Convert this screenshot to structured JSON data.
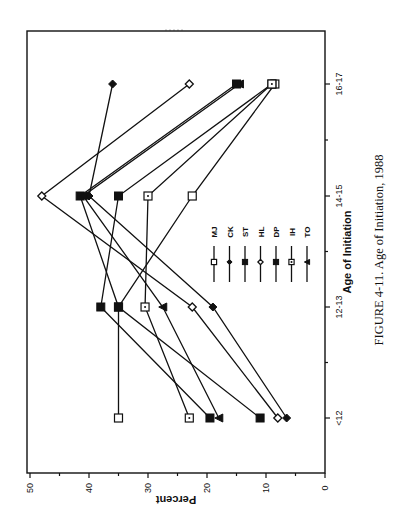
{
  "chart_data": {
    "type": "line",
    "orientation": "rotated-90-clockwise",
    "title": "",
    "caption": "FIGURE 4-11. Age of Initiation, 1988",
    "xlabel": "Age of Initiation",
    "ylabel": "Percent",
    "categories": [
      "<12",
      "12-13",
      "14-15",
      "16-17"
    ],
    "ylim": [
      0,
      50
    ],
    "yticks": [
      0,
      10,
      20,
      30,
      40,
      50
    ],
    "grid": false,
    "legend_position": "center-right",
    "series": [
      {
        "name": "MJ",
        "marker": "open-square",
        "values": [
          35,
          35,
          22.5,
          8.5
        ]
      },
      {
        "name": "CK",
        "marker": "filled-diamond",
        "values": [
          6.5,
          19,
          40,
          36
        ]
      },
      {
        "name": "ST",
        "marker": "filled-square",
        "values": [
          11,
          35,
          41.5,
          15
        ]
      },
      {
        "name": "HL",
        "marker": "open-diamond",
        "values": [
          8,
          22.5,
          48,
          23
        ]
      },
      {
        "name": "DP",
        "marker": "filled-square",
        "values": [
          19.5,
          38,
          35,
          9
        ]
      },
      {
        "name": "IH",
        "marker": "dotted-square",
        "values": [
          23,
          30.5,
          30,
          9
        ]
      },
      {
        "name": "TO",
        "marker": "filled-triangle",
        "values": [
          18,
          27.5,
          41,
          14.5
        ]
      }
    ]
  }
}
